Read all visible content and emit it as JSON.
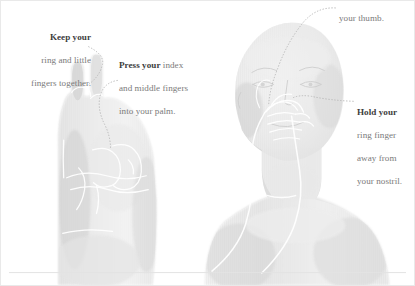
{
  "illustration": {
    "title": "Breathing technique hand position illustration",
    "ground_line_color": "#e2e2e2",
    "figure_tone": "#dcdcdc",
    "overlay_line_color": "#ffffff",
    "leader_line_color": "#b9b9b9",
    "subjects": [
      {
        "name": "hand-illustration",
        "description": "Hand held upright with ring and little fingers extended and index and middle fingers folded into the palm"
      },
      {
        "name": "person-illustration",
        "description": "Head and torso of a person with one hand raised to the nose"
      }
    ]
  },
  "callouts": {
    "keep": {
      "lead": "Keep your",
      "line2": "ring and little",
      "line3": "fingers together."
    },
    "press": {
      "lead": "Press your",
      "lead_tail": " index",
      "line2": "and middle fingers",
      "line3": "into your palm."
    },
    "thumb": {
      "line1": "your thumb."
    },
    "hold": {
      "lead": "Hold your",
      "line2": "ring finger",
      "line3": "away from",
      "line4": "your nostril."
    }
  }
}
